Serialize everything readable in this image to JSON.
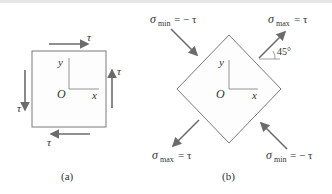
{
  "figure": {
    "panel_a": {
      "caption": "(a)",
      "shear_symbol": "τ",
      "axis_x": "x",
      "axis_y": "y",
      "origin": "O",
      "shear_labels": [
        "τ",
        "τ",
        "τ",
        "τ"
      ]
    },
    "panel_b": {
      "caption": "(b)",
      "axis_x": "x",
      "axis_y": "y",
      "origin": "O",
      "angle_label": "45°",
      "sigma": "σ",
      "min_sub": "min",
      "max_sub": "max",
      "min_value": "= − τ",
      "max_value": "= τ"
    }
  },
  "colors": {
    "arrow": "#6b6b6b",
    "outline": "#7a7a7a",
    "fill": "#fdfdfd",
    "text": "#333333"
  }
}
